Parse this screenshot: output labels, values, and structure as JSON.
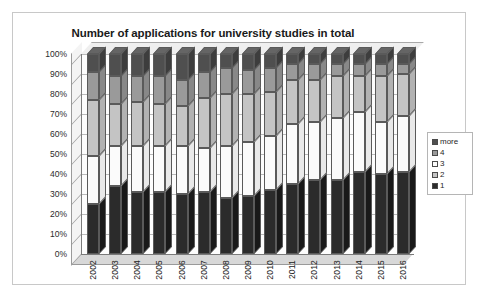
{
  "chart_data": {
    "type": "bar",
    "subtype": "stacked-100-percent-3d",
    "title": "Number of applications for university studies in total",
    "xlabel": "",
    "ylabel": "",
    "categories": [
      "2002",
      "2003",
      "2004",
      "2005",
      "2006",
      "2007",
      "2008",
      "2009",
      "2010",
      "2011",
      "2012",
      "2013",
      "2014",
      "2015",
      "2016"
    ],
    "ylim": [
      0,
      100
    ],
    "ytick_labels": [
      "0%",
      "10%",
      "20%",
      "30%",
      "40%",
      "50%",
      "60%",
      "70%",
      "80%",
      "90%",
      "100%"
    ],
    "ytick_values": [
      0,
      10,
      20,
      30,
      40,
      50,
      60,
      70,
      80,
      90,
      100
    ],
    "grid": true,
    "legend_position": "right",
    "series": [
      {
        "name": "1",
        "color": "#2b2b2b",
        "values": [
          25,
          34,
          31,
          31,
          30,
          31,
          28,
          29,
          32,
          35,
          37,
          37,
          41,
          40,
          41
        ]
      },
      {
        "name": "2",
        "color": "#fbfbfb",
        "values": [
          24,
          20,
          23,
          23,
          24,
          22,
          26,
          27,
          27,
          30,
          29,
          31,
          30,
          26,
          28
        ]
      },
      {
        "name": "3",
        "color": "#c4c4c4",
        "values": [
          28,
          21,
          22,
          21,
          20,
          25,
          26,
          24,
          22,
          22,
          21,
          21,
          18,
          23,
          21
        ]
      },
      {
        "name": "4",
        "color": "#9a9a9a",
        "values": [
          14,
          14,
          13,
          14,
          13,
          13,
          13,
          12,
          12,
          8,
          8,
          6,
          6,
          6,
          5
        ]
      },
      {
        "name": "more",
        "color": "#4f4f4f",
        "values": [
          9,
          11,
          11,
          11,
          13,
          9,
          7,
          8,
          7,
          5,
          5,
          5,
          5,
          5,
          5
        ]
      }
    ],
    "legend_entries": [
      {
        "label": "more",
        "color": "#4f4f4f"
      },
      {
        "label": "4",
        "color": "#9a9a9a"
      },
      {
        "label": "3",
        "color": "#fbfbfb"
      },
      {
        "label": "2",
        "color": "#c4c4c4"
      },
      {
        "label": "1",
        "color": "#2b2b2b"
      }
    ]
  }
}
